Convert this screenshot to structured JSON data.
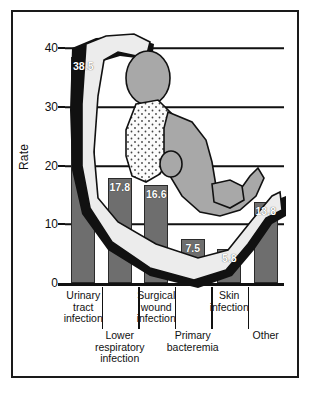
{
  "chart_data": {
    "type": "bar",
    "title": "",
    "xlabel": "",
    "ylabel": "Rate",
    "ylim": [
      0,
      40
    ],
    "yticks": [
      0,
      10,
      20,
      30,
      40
    ],
    "grid": true,
    "legend": false,
    "categories": [
      "Urinary\ntract\ninfection",
      "Lower\nrespiratory\ninfection",
      "Surgical\nwound\ninfection",
      "Primary\nbacteremia",
      "Skin\ninfection",
      "Other"
    ],
    "values": [
      38.5,
      17.8,
      16.6,
      7.5,
      5.8,
      13.8
    ],
    "value_labels": [
      "38.5",
      "17.8",
      "16.6",
      "7.5",
      "5.8",
      "13.8"
    ],
    "bar_color": "#6e6e6e",
    "bar_border_color": "#2a2a2a",
    "value_label_color": "#ffffff",
    "axis_color": "#111111",
    "background_color": "#ffffff",
    "frame_color": "#1a1a1a",
    "annotation": "reclining-patient-illustration-overlay"
  },
  "axis": {
    "y_title": "Rate",
    "y_tick_labels": [
      "40",
      "30",
      "20",
      "10",
      "0"
    ]
  },
  "categories_flat": [
    {
      "label": "Urinary\ntract\ninfection",
      "row": "top"
    },
    {
      "label": "Lower\nrespiratory\ninfection",
      "row": "bottom"
    },
    {
      "label": "Surgical\nwound\ninfection",
      "row": "top"
    },
    {
      "label": "Primary\nbacteremia",
      "row": "bottom"
    },
    {
      "label": "Skin\ninfection",
      "row": "top"
    },
    {
      "label": "Other",
      "row": "bottom"
    }
  ]
}
